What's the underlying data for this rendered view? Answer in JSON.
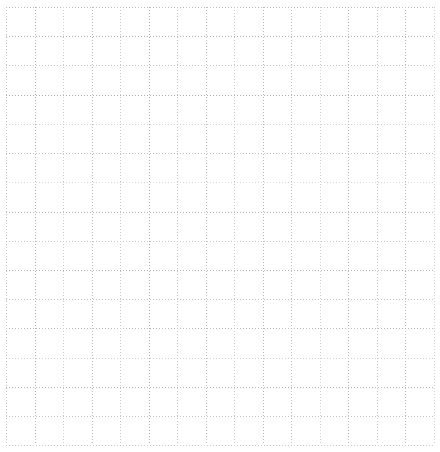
{
  "page": {
    "kind": "blank-grid-canvas",
    "width": 440,
    "height": 452,
    "background_color": "#ffffff",
    "has_text": false,
    "has_labels": false,
    "has_data_marks": false
  },
  "chart_data": {
    "type": "table",
    "title": "",
    "subtitle": "",
    "xlabel": "",
    "ylabel": "",
    "annotations": [],
    "legend": [],
    "legend_position": "none",
    "grid": true,
    "series": [],
    "categories": [],
    "values": [],
    "xticklabels": [],
    "yticklabels": []
  },
  "grid": {
    "line_style": "dashed",
    "dash_pattern": "1 2",
    "stroke_width": 1,
    "default_color": "#bdbdbd",
    "major_color": "#9a9a9a",
    "minor_color": "#d2d2d2",
    "x_start": 6,
    "x_end": 434,
    "y_start": 7,
    "y_end": 445,
    "column_count": 15,
    "row_count": 15,
    "x_positions": [
      6,
      34.5,
      63,
      91.5,
      120,
      148.5,
      177,
      205.5,
      234,
      262.5,
      291,
      319.5,
      348,
      376.5,
      405,
      433.5
    ],
    "y_positions": [
      7,
      36.2,
      65.4,
      94.6,
      123.9,
      153.1,
      182.3,
      211.5,
      240.7,
      269.9,
      299.1,
      328.4,
      357.6,
      386.8,
      416,
      445.2
    ],
    "vertical_colors": [
      "#c4c4c4",
      "#b4b4b4",
      "#cfcfcf",
      "#bdbdbd",
      "#c9c9c9",
      "#b0b0b0",
      "#c6c6c6",
      "#bbbbbb",
      "#cccccc",
      "#b6b6b6",
      "#c2c2c2",
      "#d0d0d0",
      "#b8b8b8",
      "#c7c7c7",
      "#bebebe",
      "#d6d6d6"
    ],
    "horizontal_colors": [
      "#bfbfbf",
      "#b2b2b2",
      "#c8c8c8",
      "#aeaeae",
      "#d4d4d4",
      "#c1c1c1",
      "#d8d8d8",
      "#b9b9b9",
      "#cacaca",
      "#b5b5b5",
      "#c5c5c5",
      "#bcbcbc",
      "#d1d1d1",
      "#b7b7b7",
      "#c3c3c3",
      "#cdcdcd"
    ]
  }
}
